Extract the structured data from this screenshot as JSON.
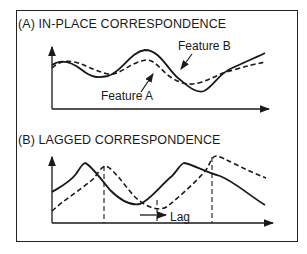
{
  "panels": [
    {
      "id": "A",
      "title": "(A) IN-PLACE CORRESPONDENCE",
      "labels": {
        "feature_b": "Feature B",
        "feature_a": "Feature A"
      },
      "series": [
        {
          "name": "Feature B",
          "style": "solid"
        },
        {
          "name": "Feature A",
          "style": "dashed"
        }
      ]
    },
    {
      "id": "B",
      "title": "(B) LAGGED CORRESPONDENCE",
      "labels": {
        "lag": "Lag"
      },
      "series": [
        {
          "name": "solid curve",
          "style": "solid"
        },
        {
          "name": "dashed curve (lagged)",
          "style": "dashed"
        }
      ]
    }
  ],
  "colors": {
    "ink": "#1a1a1a",
    "background": "#ffffff"
  }
}
